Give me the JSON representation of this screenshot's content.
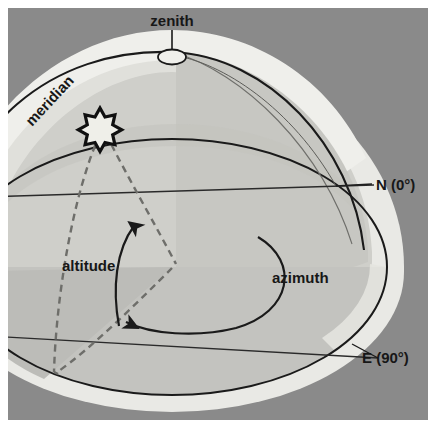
{
  "figure": {
    "title_alt": "Horizon coordinate system: altitude and azimuth on the celestial dome",
    "labels": {
      "zenith": "zenith",
      "meridian": "meridian",
      "altitude": "altitude",
      "azimuth": "azimuth",
      "north": "N (0°)",
      "east": "E (90°)"
    },
    "icons": {
      "star": "star-icon",
      "zenith_point": "zenith-point-icon",
      "altitude_arrow": "altitude-arrow-icon",
      "azimuth_arrow": "azimuth-arrow-icon",
      "zenith_leader": "zenith-leader-line",
      "east_leader": "east-leader-line"
    },
    "colors": {
      "background": "#ffffff",
      "panel": "#8a8a8a",
      "dome_outer": "#e9e9e5",
      "dome_inner": "#cfcfca",
      "horizon_plane": "#c3c3bf",
      "horizon_plane_shadow": "#b6b6b2",
      "line": "#1a1a1a",
      "dashed": "#6e6e6a",
      "text": "#171717",
      "star_fill": "#efefe9"
    },
    "geometry": {
      "panel": {
        "x": 8,
        "y": 8,
        "width": 420,
        "height": 412
      },
      "dome_center": {
        "x": 172,
        "y": 267
      },
      "horizon_rx": 215,
      "horizon_ry": 128,
      "dome_radius": 200,
      "zenith_point": {
        "x": 172,
        "y": 57
      },
      "star_point": {
        "x": 100,
        "y": 128
      }
    },
    "angles": {
      "north_azimuth_deg": 0,
      "east_azimuth_deg": 90
    }
  }
}
